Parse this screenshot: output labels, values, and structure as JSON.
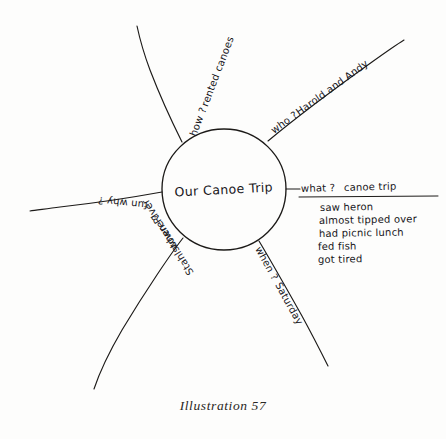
{
  "diagram": {
    "type": "hand-drawn mind map / spider map",
    "center": {
      "label": "Our Canoe Trip"
    },
    "branches": [
      {
        "id": "how",
        "position": "upper-left",
        "question": "how ?",
        "answer": "rented canoes",
        "orientation": "along-line-upright"
      },
      {
        "id": "who",
        "position": "upper-right",
        "question": "who ?",
        "answer": "Harold and Andy",
        "orientation": "along-line-upright"
      },
      {
        "id": "what",
        "position": "right",
        "question": "what ?",
        "answer": "canoe trip",
        "orientation": "horizontal-underlined",
        "details": [
          "saw heron",
          "almost tipped over",
          "had picnic lunch",
          "fed fish",
          "got tired"
        ]
      },
      {
        "id": "why",
        "position": "left",
        "question": "why ?",
        "answer": "fun",
        "orientation": "inverted"
      },
      {
        "id": "where",
        "position": "lower-left",
        "question": "where ?",
        "answer": "Stahlstown River",
        "orientation": "inverted"
      },
      {
        "id": "when",
        "position": "lower-right",
        "question": "when ?",
        "answer": "Saturday",
        "orientation": "along-line-upright"
      }
    ]
  },
  "caption": {
    "text": "Illustration 57"
  },
  "colors": {
    "ink": "#1c1a18",
    "paper": "#fdfdfc"
  }
}
